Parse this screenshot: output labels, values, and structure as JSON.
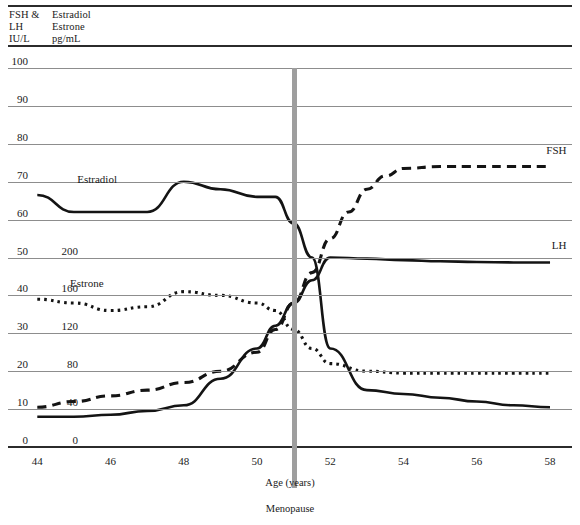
{
  "header": {
    "left_units": "FSH &\nLH\nIU/L",
    "right_units": "Estradiol\nEstrone\npg/mL"
  },
  "labels": {
    "fsh": "FSH",
    "lh": "LH",
    "estradiol": "Estradiol",
    "estrone": "Estrone",
    "menopause": "Menopause"
  },
  "chart_data": {
    "type": "line",
    "title": "",
    "xlabel": "Age (years)",
    "ylabel": "",
    "grid": true,
    "legend_position": "inline-right",
    "xlim": [
      43.2,
      58.6
    ],
    "x_ticks": [
      44,
      46,
      48,
      50,
      52,
      54,
      56,
      58
    ],
    "axes": [
      {
        "name": "FSH & LH",
        "unit": "IU/L",
        "ylim": [
          0,
          100
        ],
        "ticks": [
          0,
          10,
          20,
          30,
          40,
          50,
          60,
          70,
          80,
          90,
          100
        ]
      },
      {
        "name": "Estradiol / Estrone",
        "unit": "pg/mL",
        "ylim": [
          0,
          200
        ],
        "ticks": [
          0,
          40,
          80,
          120,
          160,
          200
        ],
        "tick_positions_on_left_scale": [
          0,
          10,
          20,
          30,
          40,
          50
        ]
      }
    ],
    "annotations": [
      {
        "text": "Menopause",
        "x": 51.0,
        "type": "vertical-marker",
        "color": "#9e9e9e"
      }
    ],
    "series": [
      {
        "name": "FSH",
        "unit": "IU/L",
        "axis": "left",
        "style": "dashed",
        "x": [
          44,
          45,
          46,
          47,
          48,
          49,
          50,
          50.5,
          51,
          51.5,
          52,
          52.5,
          53,
          53.5,
          54,
          55,
          56,
          57,
          58
        ],
        "values": [
          10.5,
          12,
          13.5,
          15,
          17,
          20,
          25,
          31,
          38,
          46,
          55,
          62,
          68,
          71.5,
          73.5,
          74,
          74,
          74,
          74
        ]
      },
      {
        "name": "LH",
        "unit": "IU/L",
        "axis": "left",
        "style": "solid",
        "x": [
          44,
          45,
          46,
          47,
          48,
          49,
          50,
          50.5,
          51,
          51.5,
          52,
          53,
          54,
          55,
          56,
          57,
          58
        ],
        "values": [
          8,
          8,
          8.5,
          9.5,
          11,
          18,
          26,
          32,
          38,
          44,
          50,
          49.7,
          49.3,
          49,
          48.8,
          48.7,
          48.7
        ]
      },
      {
        "name": "Estradiol",
        "unit": "pg/mL",
        "axis": "right",
        "style": "solid",
        "x": [
          44,
          45,
          46,
          47,
          48,
          49,
          50,
          50.5,
          51,
          51.5,
          52,
          53,
          54,
          55,
          56,
          57,
          58
        ],
        "values": [
          133,
          124,
          124,
          124,
          140,
          136,
          132,
          132,
          118,
          100,
          52,
          30,
          28,
          26,
          24,
          22,
          21
        ]
      },
      {
        "name": "Estrone",
        "unit": "pg/mL",
        "axis": "right",
        "style": "dotted",
        "x": [
          44,
          45,
          46,
          47,
          48,
          49,
          50,
          50.5,
          51,
          51.5,
          52,
          53,
          54,
          55,
          56,
          57,
          58
        ],
        "values": [
          78,
          76,
          72,
          74,
          82,
          80,
          76,
          72,
          62,
          52,
          44,
          40,
          39,
          39,
          39,
          39,
          39
        ]
      }
    ]
  }
}
